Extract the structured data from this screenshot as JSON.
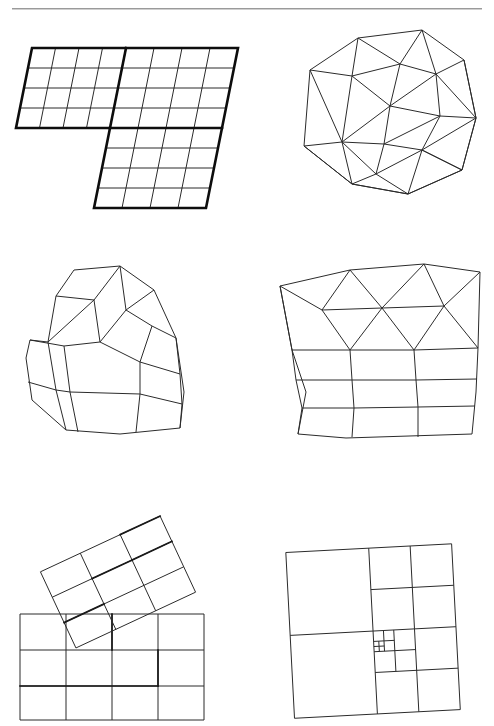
{
  "page": {
    "width": 494,
    "height": 726,
    "background_color": "#ffffff",
    "ink_color": "#2b2b2b",
    "header_rule": {
      "visible": true,
      "color": "#9a9a9a"
    }
  },
  "figure": {
    "layout": "2 columns x 3 rows",
    "panels": [
      {
        "id": "panel-a",
        "position": "top-left",
        "mesh_type": "structured-multiblock-quad",
        "description": "Two-block structured quadrilateral grid in an L/Z shape, block boundaries drawn bold",
        "blocks": 2,
        "block_1": {
          "rows": 4,
          "cols": 4
        },
        "block_2": {
          "rows": 8,
          "cols": 4
        },
        "element_shape": "quadrilateral"
      },
      {
        "id": "panel-b",
        "position": "top-right",
        "mesh_type": "unstructured-triangular",
        "description": "Unstructured triangular mesh over an irregular convex polygon",
        "element_shape": "triangle",
        "approx_triangle_count": 30,
        "approx_node_count": 20
      },
      {
        "id": "panel-c",
        "position": "middle-left",
        "mesh_type": "unstructured-quadrilateral",
        "description": "Unstructured all-quadrilateral mesh over a house-shaped domain",
        "element_shape": "quadrilateral",
        "approx_quad_count": 16
      },
      {
        "id": "panel-d",
        "position": "middle-right",
        "mesh_type": "hybrid-tri-quad",
        "description": "Hybrid mesh: triangular elements in the upper region, quadrilateral layers below",
        "element_shape": "triangle + quadrilateral",
        "approx_triangle_count": 14,
        "approx_quad_count": 12
      },
      {
        "id": "panel-e",
        "position": "bottom-left",
        "mesh_type": "overset-chimera",
        "description": "Overset (Chimera) grids: a rotated 3x3 Cartesian patch overlapping a 3x4 background grid; hole/fringe boundary drawn bold",
        "background_grid": {
          "rows": 3,
          "cols": 4
        },
        "overset_grid": {
          "rows": 3,
          "cols": 3,
          "rotation_degrees": -25
        }
      },
      {
        "id": "panel-f",
        "position": "bottom-right",
        "mesh_type": "adaptive-quadtree",
        "description": "Cartesian quadtree mesh with local refinement concentrated near the centre-right",
        "element_shape": "quadrilateral",
        "refinement_levels": 4
      }
    ]
  }
}
